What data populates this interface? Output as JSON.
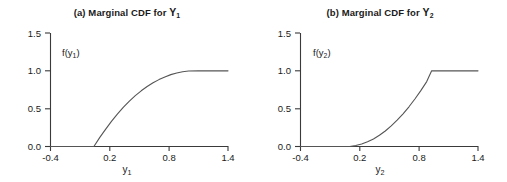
{
  "figure": {
    "background": "#ffffff",
    "axis_color": "#3a3a3a",
    "curve_color": "#555555"
  },
  "panels": [
    {
      "key": "a",
      "title_prefix": "(a) Marginal CDF for ",
      "title_var": "Y",
      "title_sub": "1",
      "curve_label_main": "f(y",
      "curve_label_sub": "1",
      "curve_label_close": ")",
      "axis_label_main": "y",
      "axis_label_sub": "1"
    },
    {
      "key": "b",
      "title_prefix": "(b) Marginal CDF for ",
      "title_var": "Y",
      "title_sub": "2",
      "curve_label_main": "f(y",
      "curve_label_sub": "2",
      "curve_label_close": ")",
      "axis_label_main": "y",
      "axis_label_sub": "2"
    }
  ],
  "chart_data": [
    {
      "type": "line",
      "title": "(a) Marginal CDF for Y1",
      "xlabel": "y1",
      "ylabel": "f(y1)",
      "xlim": [
        -0.4,
        1.4
      ],
      "ylim": [
        0.0,
        1.5
      ],
      "xticks": [
        -0.4,
        0.2,
        0.8,
        1.4
      ],
      "xtick_labels": [
        "-0.4",
        "0.2",
        "0.8",
        "1.4"
      ],
      "yticks": [
        0.0,
        0.5,
        1.0,
        1.5
      ],
      "ytick_labels": [
        "0.0",
        "0.5",
        "1.0",
        "1.5"
      ],
      "grid": false,
      "legend": false,
      "annotation": "f(y1)",
      "series": [
        {
          "name": "F(y1)",
          "x": [
            -0.4,
            -0.2,
            0.0,
            0.04,
            0.1,
            0.16,
            0.22,
            0.28,
            0.34,
            0.4,
            0.46,
            0.52,
            0.58,
            0.64,
            0.7,
            0.76,
            0.82,
            0.88,
            0.94,
            1.0,
            1.1,
            1.25,
            1.4
          ],
          "y": [
            0.0,
            0.0,
            0.0,
            0.0,
            0.12,
            0.23,
            0.335,
            0.43,
            0.52,
            0.6,
            0.672,
            0.736,
            0.792,
            0.842,
            0.884,
            0.92,
            0.95,
            0.972,
            0.988,
            0.997,
            1.0,
            1.0,
            1.0
          ]
        }
      ]
    },
    {
      "type": "line",
      "title": "(b) Marginal CDF for Y2",
      "xlabel": "y2",
      "ylabel": "f(y2)",
      "xlim": [
        -0.4,
        1.4
      ],
      "ylim": [
        0.0,
        1.5
      ],
      "xticks": [
        -0.4,
        0.2,
        0.8,
        1.4
      ],
      "xtick_labels": [
        "-0.4",
        "0.2",
        "0.8",
        "1.4"
      ],
      "yticks": [
        0.0,
        0.5,
        1.0,
        1.5
      ],
      "ytick_labels": [
        "0.0",
        "0.5",
        "1.0",
        "1.5"
      ],
      "grid": false,
      "legend": false,
      "annotation": "f(y2)",
      "series": [
        {
          "name": "F(y2)",
          "x": [
            -0.4,
            -0.2,
            0.0,
            0.1,
            0.16,
            0.22,
            0.28,
            0.34,
            0.4,
            0.46,
            0.52,
            0.58,
            0.64,
            0.7,
            0.76,
            0.82,
            0.88,
            0.93,
            1.0,
            1.15,
            1.3,
            1.4
          ],
          "y": [
            0.0,
            0.0,
            0.0,
            0.0,
            0.012,
            0.032,
            0.062,
            0.1,
            0.148,
            0.205,
            0.272,
            0.348,
            0.432,
            0.525,
            0.628,
            0.738,
            0.858,
            1.0,
            1.0,
            1.0,
            1.0,
            1.0
          ]
        }
      ]
    }
  ]
}
